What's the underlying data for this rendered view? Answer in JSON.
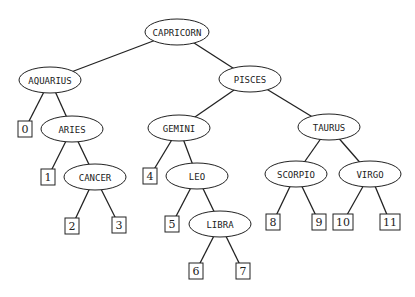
{
  "diagram": {
    "type": "binary-search-tree",
    "internal_nodes": [
      {
        "id": "capricorn",
        "label": "CAPRICORN",
        "cx": 177,
        "cy": 32,
        "rx": 32
      },
      {
        "id": "aquarius",
        "label": "AQUARIUS",
        "cx": 50,
        "cy": 80,
        "rx": 31
      },
      {
        "id": "pisces",
        "label": "PISCES",
        "cx": 250,
        "cy": 79,
        "rx": 31
      },
      {
        "id": "aries",
        "label": "ARIES",
        "cx": 72,
        "cy": 129,
        "rx": 31
      },
      {
        "id": "gemini",
        "label": "GEMINI",
        "cx": 179,
        "cy": 128,
        "rx": 31
      },
      {
        "id": "taurus",
        "label": "TAURUS",
        "cx": 329,
        "cy": 127,
        "rx": 31
      },
      {
        "id": "cancer",
        "label": "CANCER",
        "cx": 95,
        "cy": 177,
        "rx": 31
      },
      {
        "id": "leo",
        "label": "LEO",
        "cx": 197,
        "cy": 176,
        "rx": 31
      },
      {
        "id": "scorpio",
        "label": "SCORPIO",
        "cx": 296,
        "cy": 174,
        "rx": 31
      },
      {
        "id": "virgo",
        "label": "VIRGO",
        "cx": 370,
        "cy": 174,
        "rx": 31
      },
      {
        "id": "libra",
        "label": "LIBRA",
        "cx": 220,
        "cy": 224,
        "rx": 31
      }
    ],
    "leaves": [
      {
        "id": "leaf0",
        "label": "0",
        "cx": 25,
        "cy": 129
      },
      {
        "id": "leaf1",
        "label": "1",
        "cx": 48,
        "cy": 177
      },
      {
        "id": "leaf2",
        "label": "2",
        "cx": 72,
        "cy": 226
      },
      {
        "id": "leaf3",
        "label": "3",
        "cx": 119,
        "cy": 225
      },
      {
        "id": "leaf4",
        "label": "4",
        "cx": 150,
        "cy": 176
      },
      {
        "id": "leaf5",
        "label": "5",
        "cx": 172,
        "cy": 224
      },
      {
        "id": "leaf6",
        "label": "6",
        "cx": 196,
        "cy": 271
      },
      {
        "id": "leaf7",
        "label": "7",
        "cx": 243,
        "cy": 271
      },
      {
        "id": "leaf8",
        "label": "8",
        "cx": 273,
        "cy": 222
      },
      {
        "id": "leaf9",
        "label": "9",
        "cx": 319,
        "cy": 222
      },
      {
        "id": "leaf10",
        "label": "10",
        "cx": 343,
        "cy": 222
      },
      {
        "id": "leaf11",
        "label": "11",
        "cx": 390,
        "cy": 222
      }
    ],
    "edges": [
      [
        "capricorn",
        "aquarius"
      ],
      [
        "capricorn",
        "pisces"
      ],
      [
        "aquarius",
        "leaf0"
      ],
      [
        "aquarius",
        "aries"
      ],
      [
        "aries",
        "leaf1"
      ],
      [
        "aries",
        "cancer"
      ],
      [
        "cancer",
        "leaf2"
      ],
      [
        "cancer",
        "leaf3"
      ],
      [
        "pisces",
        "gemini"
      ],
      [
        "pisces",
        "taurus"
      ],
      [
        "gemini",
        "leaf4"
      ],
      [
        "gemini",
        "leo"
      ],
      [
        "leo",
        "leaf5"
      ],
      [
        "leo",
        "libra"
      ],
      [
        "libra",
        "leaf6"
      ],
      [
        "libra",
        "leaf7"
      ],
      [
        "taurus",
        "scorpio"
      ],
      [
        "taurus",
        "virgo"
      ],
      [
        "scorpio",
        "leaf8"
      ],
      [
        "scorpio",
        "leaf9"
      ],
      [
        "virgo",
        "leaf10"
      ],
      [
        "virgo",
        "leaf11"
      ]
    ]
  }
}
